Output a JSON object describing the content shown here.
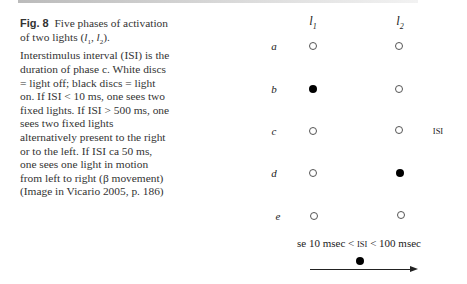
{
  "figure": {
    "label": "Fig. 8",
    "caption_parts": [
      "Five phases of activation of two lights (",
      "l",
      "1",
      ", ",
      "l",
      "2",
      "). Interstimulus interval (ISI) is the duration of phase c. White discs = light off; black discs = light on. If ISI < 10 ms, one sees two fixed lights. If ISI > 500 ms, one sees two fixed lights alternatively present to the right or to the left. If ISI ca 50 ms, one sees one light in motion from left to right (β movement) (Image in Vicario 2005, p. 186)"
    ]
  },
  "diagram": {
    "columns": [
      {
        "name": "l",
        "sub": "1"
      },
      {
        "name": "l",
        "sub": "2"
      }
    ],
    "rows": [
      {
        "label": "a",
        "l1": "off",
        "l2": "off"
      },
      {
        "label": "b",
        "l1": "on",
        "l2": "off"
      },
      {
        "label": "c",
        "l1": "off",
        "l2": "off",
        "annotation": "ISI"
      },
      {
        "label": "d",
        "l1": "off",
        "l2": "on"
      },
      {
        "label": "e",
        "l1": "off",
        "l2": "off"
      }
    ],
    "condition": {
      "prefix": "se 10 msec < ",
      "isi": "ISI",
      "suffix": " < 100 msec"
    },
    "motion_indicator": "moving-light-arrow-right"
  }
}
